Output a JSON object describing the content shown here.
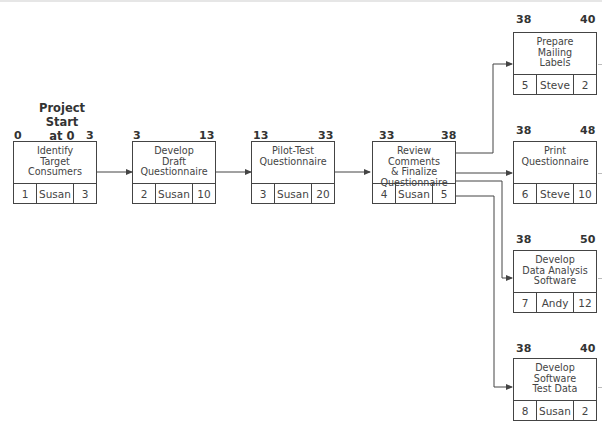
{
  "start_label": "Project\nStart\nat 0",
  "start_lines": [
    "Project",
    "Start",
    "at 0"
  ],
  "nodes": [
    {
      "id": "1",
      "name": "Identify\nTarget\nConsumers",
      "resource": "Susan",
      "duration": "10",
      "duration_shown": "3",
      "early_start": "0",
      "early_finish": "3"
    },
    {
      "id": "2",
      "name": "Develop\nDraft\nQuestionnaire",
      "resource": "Susan",
      "duration_shown": "10",
      "early_start": "3",
      "early_finish": "13"
    },
    {
      "id": "3",
      "name": "Pilot-Test\nQuestionnaire",
      "resource": "Susan",
      "duration_shown": "20",
      "early_start": "13",
      "early_finish": "33"
    },
    {
      "id": "4",
      "name": "Review Comments\n& Finalize\nQuestionnaire",
      "resource": "Susan",
      "duration_shown": "5",
      "early_start": "33",
      "early_finish": "38"
    },
    {
      "id": "5",
      "name": "Prepare\nMailing\nLabels",
      "resource": "Steve",
      "duration_shown": "2",
      "early_start": "38",
      "early_finish": "40"
    },
    {
      "id": "6",
      "name": "Print\nQuestionnaire",
      "resource": "Steve",
      "duration_shown": "10",
      "early_start": "38",
      "early_finish": "48"
    },
    {
      "id": "7",
      "name": "Develop\nData Analysis\nSoftware",
      "resource": "Andy",
      "duration_shown": "12",
      "early_start": "38",
      "early_finish": "50"
    },
    {
      "id": "8",
      "name": "Develop\nSoftware\nTest Data",
      "resource": "Susan",
      "duration_shown": "2",
      "early_start": "38",
      "early_finish": "40"
    }
  ],
  "colors": {
    "line": "#444444",
    "text": "#333333"
  }
}
